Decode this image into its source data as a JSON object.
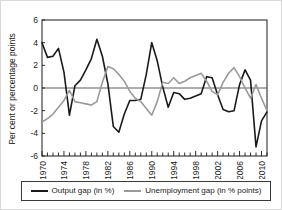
{
  "figure": {
    "background_color": "#ffffff",
    "border_color": "#d8d8d8"
  },
  "legend": {
    "position": "below-axes",
    "entries": [
      {
        "label": "Output gap (in %)",
        "color": "#1a1a1a",
        "icon": "line-swatch-icon"
      },
      {
        "label": "Unemployment gap (in % points)",
        "color": "#9a9a9a",
        "icon": "line-swatch-icon"
      }
    ]
  },
  "chart_data": {
    "type": "line",
    "title": "",
    "xlabel": "",
    "ylabel": "Per cent or percentage points",
    "xlim": [
      1970,
      2011
    ],
    "ylim": [
      -6,
      6
    ],
    "ytick_values": [
      -6,
      -4,
      -2,
      0,
      2,
      4,
      6
    ],
    "ytick_labels": [
      "-6",
      "-4",
      "-2",
      "0",
      "2",
      "4",
      "6"
    ],
    "xtick_values": [
      1970,
      1974,
      1978,
      1982,
      1986,
      1990,
      1994,
      1998,
      2002,
      2006,
      2010
    ],
    "xtick_labels": [
      "1970",
      "1974",
      "1978",
      "1982",
      "1986",
      "1990",
      "1994",
      "1998",
      "2002",
      "2006",
      "2010"
    ],
    "minor_xticks_every": 1,
    "grid": false,
    "zero_line": true,
    "x": [
      1970,
      1971,
      1972,
      1973,
      1974,
      1975,
      1976,
      1977,
      1978,
      1979,
      1980,
      1981,
      1982,
      1983,
      1984,
      1985,
      1986,
      1987,
      1988,
      1989,
      1990,
      1991,
      1992,
      1993,
      1994,
      1995,
      1996,
      1997,
      1998,
      1999,
      2000,
      2001,
      2002,
      2003,
      2004,
      2005,
      2006,
      2007,
      2008,
      2009,
      2010,
      2011
    ],
    "series": [
      {
        "name": "Output gap (in %)",
        "color": "#1a1a1a",
        "units": "per cent",
        "values": [
          4.0,
          2.7,
          2.8,
          3.5,
          1.4,
          -2.4,
          0.2,
          0.7,
          1.6,
          2.6,
          4.3,
          2.8,
          0.4,
          -3.4,
          -3.9,
          -2.3,
          -1.1,
          -1.1,
          -1.0,
          1.2,
          4.0,
          2.4,
          0.1,
          -1.7,
          -0.4,
          -0.5,
          -1.0,
          -0.9,
          -0.7,
          -0.5,
          1.0,
          0.9,
          -0.6,
          -1.9,
          -2.1,
          -2.0,
          0.3,
          1.6,
          0.7,
          -5.2,
          -2.9,
          -2.1
        ]
      },
      {
        "name": "Unemployment gap (in % points)",
        "color": "#9a9a9a",
        "units": "percentage points",
        "values": [
          -3.0,
          -2.7,
          -2.3,
          -1.7,
          -1.1,
          -0.2,
          -1.2,
          -1.3,
          -1.4,
          -1.5,
          -1.2,
          0.5,
          1.9,
          1.7,
          1.2,
          0.6,
          -0.3,
          -0.9,
          -1.2,
          -1.8,
          -2.4,
          -1.2,
          0.5,
          0.4,
          0.9,
          0.4,
          0.6,
          0.9,
          1.1,
          1.3,
          0.6,
          -0.3,
          -0.6,
          0.5,
          1.3,
          1.8,
          1.0,
          0.0,
          -0.9,
          0.3,
          -0.9,
          -2.0
        ]
      }
    ]
  }
}
